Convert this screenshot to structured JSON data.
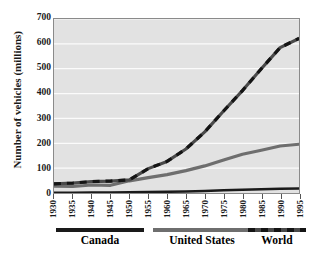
{
  "chart_data": {
    "type": "line",
    "title": "",
    "xlabel": "",
    "ylabel": "Number of vehicles  (millions)",
    "xlim": [
      1930,
      1995
    ],
    "ylim": [
      0,
      700
    ],
    "grid": true,
    "legend_position": "bottom",
    "x": [
      1930,
      1935,
      1940,
      1945,
      1950,
      1955,
      1960,
      1965,
      1970,
      1975,
      1980,
      1985,
      1990,
      1995
    ],
    "xticklabels": [
      "1930",
      "1935",
      "1940",
      "1945",
      "1950",
      "1955",
      "1960",
      "1965",
      "1970",
      "1975",
      "1980",
      "1985",
      "1990",
      "1995"
    ],
    "yticklabels": [
      "0",
      "100",
      "200",
      "300",
      "400",
      "500",
      "600",
      "700"
    ],
    "yticks": [
      0,
      100,
      200,
      300,
      400,
      500,
      600,
      700
    ],
    "series": [
      {
        "name": "Canada",
        "color": "#1a1a1a",
        "style": "solid",
        "values": [
          1,
          1,
          2,
          2,
          3,
          4,
          5,
          6,
          8,
          11,
          13,
          15,
          17,
          18
        ]
      },
      {
        "name": "United States",
        "color": "#6e6e6e",
        "style": "solid",
        "values": [
          27,
          26,
          32,
          31,
          49,
          62,
          74,
          90,
          109,
          133,
          156,
          172,
          189,
          196
        ]
      },
      {
        "name": "World",
        "color": "#4a4a4a",
        "style": "dashed",
        "values": [
          37,
          40,
          46,
          48,
          53,
          98,
          127,
          177,
          246,
          330,
          412,
          500,
          585,
          622
        ]
      }
    ]
  },
  "legend": {
    "items": [
      {
        "label": "Canada",
        "color": "#1a1a1a",
        "style": "solid"
      },
      {
        "label": "United States",
        "color": "#6e6e6e",
        "style": "solid"
      },
      {
        "label": "World",
        "color": "#4a4a4a",
        "style": "dashed"
      }
    ]
  },
  "axes": {
    "y_title": "Number of vehicles  (millions)"
  }
}
